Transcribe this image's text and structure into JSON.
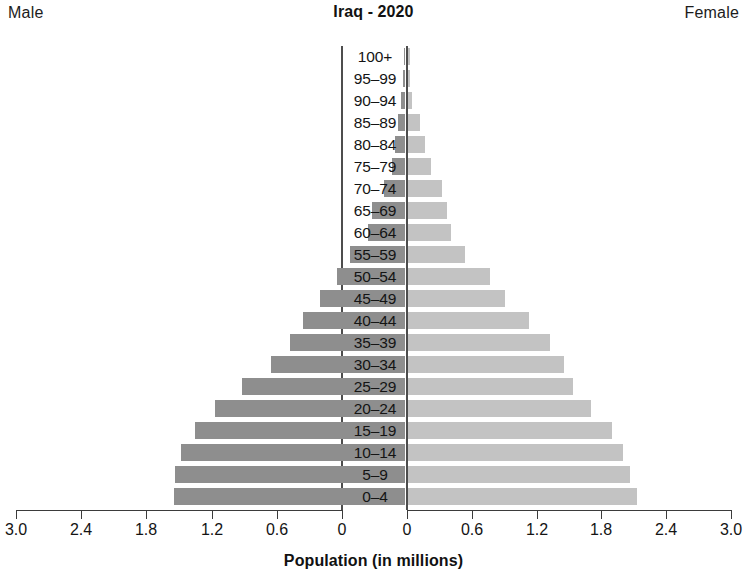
{
  "header": {
    "male_label": "Male",
    "female_label": "Female",
    "title": "Iraq - 2020"
  },
  "axis": {
    "x_title": "Population (in millions)",
    "ticks": [
      "3.0",
      "2.4",
      "1.8",
      "1.2",
      "0.6",
      "0"
    ],
    "ticks_right": [
      "0",
      "0.6",
      "1.2",
      "1.8",
      "2.4",
      "3.0"
    ],
    "x_max": 3.0,
    "tick_step": 0.6
  },
  "colors": {
    "male_bar": "#8e8e8e",
    "female_bar": "#c3c3c3",
    "axis": "#3b3b3b",
    "text": "#141414",
    "background": "#ffffff"
  },
  "chart_data": {
    "type": "bar",
    "subtype": "population-pyramid",
    "title": "Iraq - 2020",
    "xlabel": "Population (in millions)",
    "ylabel": "",
    "xlim": [
      0,
      3.0
    ],
    "xticks": [
      0,
      0.6,
      1.2,
      1.8,
      2.4,
      3.0
    ],
    "grid": false,
    "legend": [
      "Male",
      "Female"
    ],
    "legend_position": "top-left and top-right corners",
    "orientation": "horizontal",
    "categories": [
      "100+",
      "95–99",
      "90–94",
      "85–89",
      "80–84",
      "75–79",
      "70–74",
      "65–69",
      "60–64",
      "55–59",
      "50–54",
      "45–49",
      "40–44",
      "35–39",
      "30–34",
      "25–29",
      "20–24",
      "15–19",
      "10–14",
      "5–9",
      "0–4"
    ],
    "series": [
      {
        "name": "Male",
        "side": "left",
        "color": "#8e8e8e",
        "values": [
          0.01,
          0.02,
          0.04,
          0.06,
          0.09,
          0.12,
          0.19,
          0.3,
          0.34,
          0.51,
          0.63,
          0.78,
          0.94,
          1.06,
          1.23,
          1.5,
          1.75,
          1.93,
          2.06,
          2.12,
          2.13
        ]
      },
      {
        "name": "Female",
        "side": "right",
        "color": "#c3c3c3",
        "values": [
          0.01,
          0.02,
          0.04,
          0.11,
          0.16,
          0.21,
          0.32,
          0.36,
          0.4,
          0.53,
          0.76,
          0.9,
          1.12,
          1.32,
          1.45,
          1.53,
          1.7,
          1.9,
          2.0,
          2.06,
          2.13
        ]
      }
    ]
  }
}
